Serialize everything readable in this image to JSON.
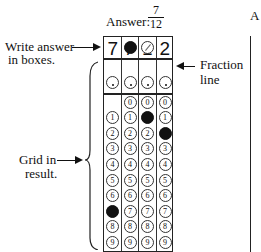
{
  "title": {
    "label": "Answer:",
    "fraction_numerator": "7",
    "fraction_denominator": "12"
  },
  "answer_boxes": [
    "7",
    "/",
    "1",
    "2"
  ],
  "annotations": {
    "write_answer": "Write answer in boxes.",
    "write_answer_line1": "Write answer",
    "write_answer_line2": "in boxes.",
    "fraction_line_line1": "Fraction",
    "fraction_line_line2": "line",
    "grid_line1": "Grid in",
    "grid_line2": "result."
  },
  "grid": {
    "columns": 4,
    "slash_row": [
      false,
      true,
      true,
      false
    ],
    "slash_filled": [
      false,
      true,
      false,
      false
    ],
    "dot_row": [
      true,
      true,
      true,
      true
    ],
    "digit_rows": [
      "0",
      "1",
      "2",
      "3",
      "4",
      "5",
      "6",
      "7",
      "8",
      "9"
    ],
    "column_digit_ranges": [
      [
        1,
        9
      ],
      [
        0,
        9
      ],
      [
        0,
        9
      ],
      [
        0,
        9
      ]
    ],
    "filled": [
      {
        "col": 0,
        "digit": "7"
      },
      {
        "col": 1,
        "symbol": "/"
      },
      {
        "col": 2,
        "digit": "1"
      },
      {
        "col": 3,
        "digit": "2"
      }
    ]
  },
  "second_grid_partial": {
    "label_fragment": "A"
  }
}
